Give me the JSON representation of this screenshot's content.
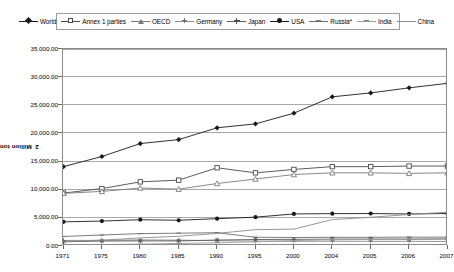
{
  "chart_data": {
    "type": "line",
    "title": "",
    "xlabel": "",
    "ylabel": "Million tonnes CO2",
    "ylabel_main": "Million tonnes CO",
    "ylabel_sub": "2",
    "ylim": [
      0,
      35000
    ],
    "ytick_step": 5000,
    "grid": true,
    "legend_position": "top",
    "categories": [
      "1971",
      "1975",
      "1980",
      "1985",
      "1990",
      "1995",
      "2000",
      "2004",
      "2005",
      "2006",
      "2007"
    ],
    "ytick_labels": [
      "35,000.00",
      "30,000.00",
      "25,000.00",
      "20,000.00",
      "15,000.00",
      "10,000.00",
      "5,000.00",
      "0.00"
    ],
    "ytick_values": [
      35000,
      30000,
      25000,
      20000,
      15000,
      10000,
      5000,
      0
    ],
    "series": [
      {
        "name": "World",
        "marker": "diamond",
        "color": "#1a1a1a",
        "values": [
          14100,
          15900,
          18200,
          18900,
          21000,
          21700,
          23600,
          26500,
          27200,
          28100,
          28900
        ]
      },
      {
        "name": "Annex 1 parties",
        "marker": "square",
        "color": "#4a4a4a",
        "values": [
          9400,
          10200,
          11400,
          11700,
          13900,
          13000,
          13600,
          14100,
          14100,
          14200,
          14200
        ]
      },
      {
        "name": "OECD",
        "marker": "triangle",
        "color": "#7a7a7a",
        "values": [
          9350,
          9700,
          10300,
          10100,
          11100,
          11900,
          12700,
          13000,
          13000,
          12900,
          13000
        ]
      },
      {
        "name": "Germany",
        "marker": "plus",
        "color": "#8a8a8a",
        "values": [
          980,
          1010,
          1080,
          1040,
          950,
          880,
          830,
          850,
          830,
          830,
          800
        ]
      },
      {
        "name": "Japan",
        "marker": "star",
        "color": "#5a5a5a",
        "values": [
          750,
          880,
          900,
          900,
          1060,
          1150,
          1180,
          1220,
          1230,
          1210,
          1240
        ]
      },
      {
        "name": "USA",
        "marker": "dot",
        "color": "#1a1a1a",
        "values": [
          4290,
          4430,
          4670,
          4570,
          4860,
          5120,
          5700,
          5750,
          5770,
          5690,
          5770
        ]
      },
      {
        "name": "Russia*",
        "marker": "dash",
        "color": "#6e6e6e",
        "values": [
          1700,
          1950,
          2200,
          2280,
          2360,
          1550,
          1510,
          1540,
          1540,
          1580,
          1580
        ]
      },
      {
        "name": "India",
        "marker": "dash2",
        "color": "#9a9a9a",
        "values": [
          200,
          260,
          330,
          450,
          580,
          750,
          970,
          1110,
          1160,
          1250,
          1320
        ]
      },
      {
        "name": "China",
        "marker": "none",
        "color": "#8a8a8a",
        "values": [
          800,
          1030,
          1430,
          1730,
          2240,
          2900,
          3000,
          4700,
          5100,
          5600,
          6000
        ]
      }
    ]
  }
}
